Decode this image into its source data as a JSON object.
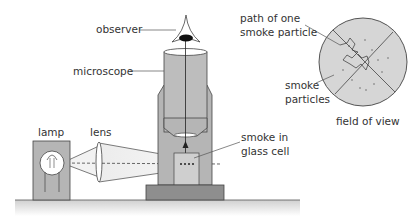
{
  "labels": {
    "observer": "observer",
    "microscope": "microscope",
    "lamp": "lamp",
    "lens": "lens",
    "smoke_cell_line1": "smoke in",
    "smoke_cell_line2": "glass cell",
    "path_line1": "path of one",
    "path_line2": "smoke particle",
    "particles_line1": "smoke",
    "particles_line2": "particles",
    "field_of_view": "field of view"
  },
  "colors": {
    "body_gray": "#b5b5b5",
    "dark_gray": "#8e8e8e",
    "outline": "#3a3a3a",
    "field_fill": "#d6d6d6",
    "text": "#333333"
  }
}
